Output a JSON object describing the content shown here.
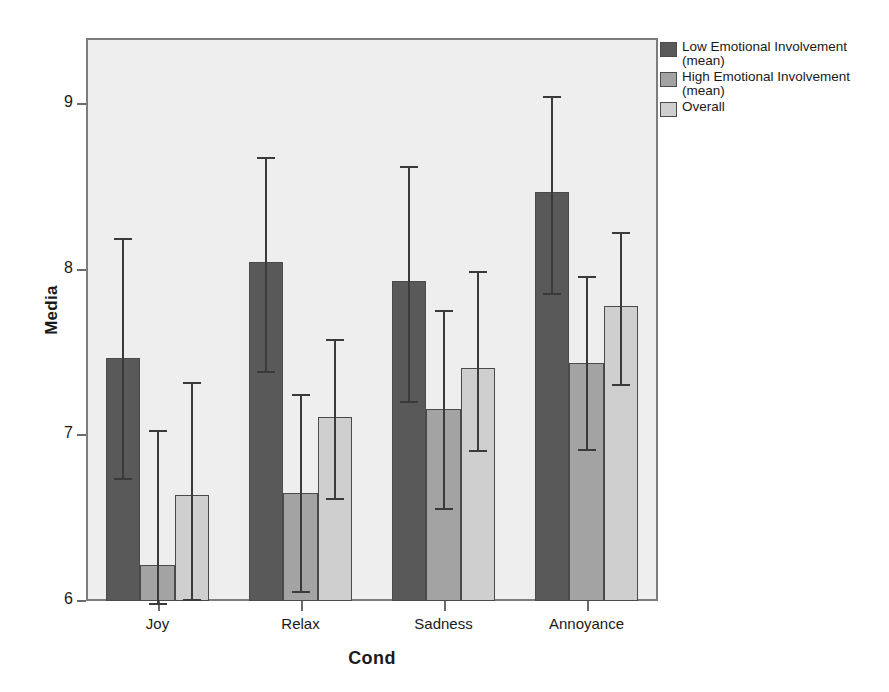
{
  "chart_data": {
    "type": "bar",
    "title": "",
    "xlabel": "Cond",
    "ylabel": "Media",
    "categories": [
      "Joy",
      "Relax",
      "Sadness",
      "Annoyance"
    ],
    "ylim": [
      6,
      9.4
    ],
    "yticks": [
      6,
      7,
      8,
      9
    ],
    "ytick_labels": [
      "6",
      "7",
      "8",
      "9"
    ],
    "grid": false,
    "legend_position": "right-top",
    "error_bars": "95% CI",
    "series": [
      {
        "name": "Low Emotional Involvement (mean)",
        "color": "#595959",
        "values": [
          7.47,
          8.05,
          7.93,
          8.47
        ],
        "ci_low": [
          6.74,
          7.39,
          7.21,
          7.86
        ],
        "ci_high": [
          8.19,
          8.68,
          8.63,
          9.05
        ]
      },
      {
        "name": "High Emotional Involvement (mean)",
        "color": "#a3a3a3",
        "values": [
          6.22,
          6.65,
          7.16,
          7.44
        ],
        "ci_low": [
          5.99,
          6.06,
          6.56,
          6.92
        ],
        "ci_high": [
          7.03,
          7.25,
          7.76,
          7.96
        ]
      },
      {
        "name": "Overall",
        "color": "#cfcfcf",
        "values": [
          6.64,
          7.11,
          7.41,
          7.78
        ],
        "ci_low": [
          6.01,
          6.62,
          6.91,
          7.31
        ],
        "ci_high": [
          7.32,
          7.58,
          7.99,
          8.23
        ]
      }
    ]
  },
  "legend": {
    "items": [
      {
        "label": "Low Emotional Involvement\n(mean)",
        "color": "#595959"
      },
      {
        "label": "High Emotional Involvement\n(mean)",
        "color": "#a3a3a3"
      },
      {
        "label": "Overall",
        "color": "#cfcfcf"
      }
    ]
  },
  "axes": {
    "y_label": "Media",
    "x_label": "Cond"
  }
}
